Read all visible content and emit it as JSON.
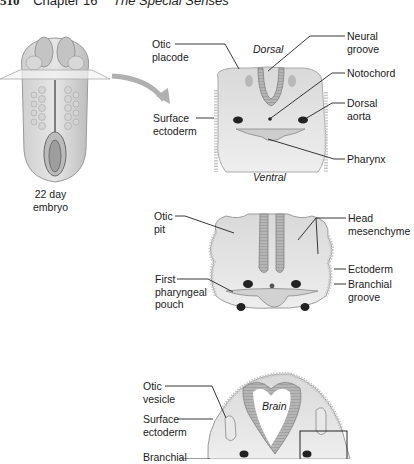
{
  "header": {
    "page_number": "510",
    "chapter": "Chapter 16",
    "subtitle": "The Special Senses"
  },
  "embryo": {
    "caption_line1": "22 day",
    "caption_line2": "embryo"
  },
  "section1": {
    "dorsal": "Dorsal",
    "ventral": "Ventral",
    "labels": {
      "otic_placode_1": "Otic",
      "otic_placode_2": "placode",
      "surface_ectoderm_1": "Surface",
      "surface_ectoderm_2": "ectoderm",
      "neural_groove_1": "Neural",
      "neural_groove_2": "groove",
      "notochord": "Notochord",
      "dorsal_aorta_1": "Dorsal",
      "dorsal_aorta_2": "aorta",
      "pharynx": "Pharynx"
    }
  },
  "section2": {
    "labels": {
      "otic_pit_1": "Otic",
      "otic_pit_2": "pit",
      "first_pouch_1": "First",
      "first_pouch_2": "pharyngeal",
      "first_pouch_3": "pouch",
      "head_mesenchyme_1": "Head",
      "head_mesenchyme_2": "mesenchyme",
      "ectoderm": "Ectoderm",
      "branchial_groove_1": "Branchial",
      "branchial_groove_2": "groove"
    }
  },
  "section3": {
    "brain": "Brain",
    "labels": {
      "otic_vesicle_1": "Otic",
      "otic_vesicle_2": "vesicle",
      "surface_ectoderm_1": "Surface",
      "surface_ectoderm_2": "ectoderm",
      "branchial_1": "Branchial"
    }
  }
}
